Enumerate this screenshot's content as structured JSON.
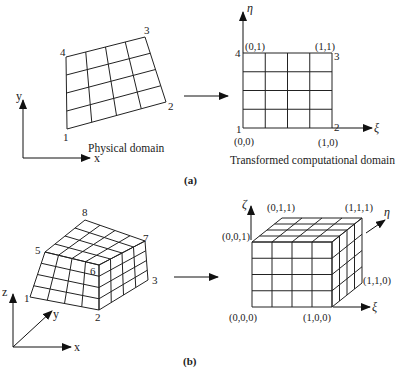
{
  "figure": {
    "part_a": {
      "label": "(a)",
      "physical": {
        "caption": "Physical domain",
        "corner_labels": [
          "1",
          "2",
          "3",
          "4"
        ],
        "axis_labels": {
          "x": "x",
          "y": "y"
        },
        "grid": {
          "cols": 4,
          "rows": 4
        }
      },
      "computational": {
        "caption": "Transformed computational domain",
        "corner_numbers": [
          "1",
          "2",
          "3",
          "4"
        ],
        "corner_coords": {
          "c1": "(0,0)",
          "c2": "(1,0)",
          "c3": "(1,1)",
          "c4": "(0,1)"
        },
        "axis_labels": {
          "xi": "ξ",
          "eta": "η"
        },
        "grid": {
          "cols": 4,
          "rows": 4
        }
      }
    },
    "part_b": {
      "label": "(b)",
      "physical": {
        "corner_labels": [
          "1",
          "2",
          "3",
          "5",
          "6",
          "7",
          "8"
        ],
        "axis_labels": {
          "x": "x",
          "y": "y",
          "z": "z"
        },
        "grid": {
          "cols": 4,
          "rows": 4,
          "depth": 4
        }
      },
      "computational": {
        "corner_coords": {
          "c000": "(0,0,0)",
          "c100": "(1,0,0)",
          "c110": "(1,1,0)",
          "c001": "(0,0,1)",
          "c011": "(0,1,1)",
          "c111": "(1,1,1)"
        },
        "axis_labels": {
          "xi": "ξ",
          "eta": "η",
          "zeta": "ζ"
        },
        "grid": {
          "cols": 4,
          "rows": 4,
          "depth": 4
        }
      }
    }
  }
}
